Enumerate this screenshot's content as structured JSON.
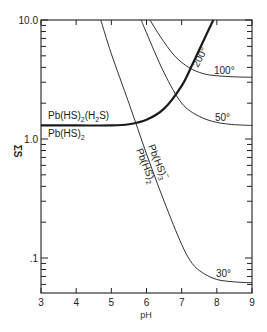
{
  "chart_data": {
    "type": "line",
    "title": "",
    "xlabel": "pH",
    "ylabel": "ΣS",
    "xlim": [
      3,
      9
    ],
    "ylim": [
      0.05,
      10.0
    ],
    "yscale": "log",
    "grid": false,
    "legend": null,
    "x_ticks": [
      3,
      4,
      5,
      6,
      7,
      8,
      9
    ],
    "x_tick_labels": [
      "3",
      "4",
      "5",
      "6",
      "7",
      "8",
      "9"
    ],
    "y_tick_labels": [
      {
        "value": 10.0,
        "label": "10.0"
      },
      {
        "value": 1.0,
        "label": "1.0"
      },
      {
        "value": 0.1,
        "label": ".1"
      }
    ],
    "series": [
      {
        "name": "200°",
        "style": "thick",
        "description": "Pb(HS)2(H2S) / Pb(HS)2 boundary",
        "x": [
          3.0,
          4.0,
          5.0,
          5.5,
          6.0,
          6.5,
          7.0,
          7.3,
          7.6,
          7.9
        ],
        "y": [
          1.3,
          1.3,
          1.3,
          1.33,
          1.45,
          1.8,
          2.8,
          4.2,
          6.5,
          10.0
        ]
      },
      {
        "name": "30°",
        "style": "thin",
        "x": [
          4.7,
          5.0,
          5.5,
          6.0,
          6.5,
          7.0,
          7.3,
          7.6,
          8.0,
          8.5,
          9.0
        ],
        "y": [
          10.0,
          5.2,
          2.0,
          0.75,
          0.3,
          0.13,
          0.09,
          0.075,
          0.066,
          0.063,
          0.062
        ]
      },
      {
        "name": "50°",
        "style": "thin",
        "x": [
          5.85,
          6.0,
          6.5,
          7.0,
          7.5,
          8.0,
          8.5,
          9.0
        ],
        "y": [
          10.0,
          7.8,
          3.6,
          2.0,
          1.55,
          1.38,
          1.32,
          1.3
        ]
      },
      {
        "name": "100°",
        "style": "thin",
        "x": [
          6.1,
          6.4,
          6.8,
          7.2,
          7.6,
          8.0,
          8.5,
          9.0
        ],
        "y": [
          10.0,
          7.2,
          5.0,
          4.0,
          3.55,
          3.4,
          3.33,
          3.3
        ]
      }
    ],
    "annotations": [
      {
        "text": "Pb(HS)2(H2S)",
        "x": 3.15,
        "y": 1.55,
        "rotation": 0
      },
      {
        "text": "Pb(HS)2",
        "x": 3.15,
        "y": 1.05,
        "rotation": 0
      },
      {
        "text": "Pb(HS)3⁻",
        "x": 5.9,
        "y": 0.75,
        "rotation": 68
      },
      {
        "text": "Pb(HS)2",
        "x": 5.6,
        "y": 0.8,
        "rotation": 68
      },
      {
        "text": "200°",
        "x": 7.25,
        "y": 5.5,
        "rotation": -62
      },
      {
        "text": "100°",
        "x": 8.1,
        "y": 3.9,
        "rotation": 0
      },
      {
        "text": "50°",
        "x": 8.1,
        "y": 1.55,
        "rotation": 0
      },
      {
        "text": "30°",
        "x": 8.0,
        "y": 0.075,
        "rotation": 0
      }
    ]
  },
  "labels": {
    "ylabel": "ΣS",
    "xlabel": "pH",
    "region_upper": "Pb(HS)",
    "region_upper_sub1": "2",
    "region_upper_mid": "(H",
    "region_upper_sub2": "2",
    "region_upper_end": "S)",
    "region_lower": "Pb(HS)",
    "region_lower_sub": "2",
    "diag_a": "Pb(HS)",
    "diag_a_sub": "3",
    "diag_a_sup": "−",
    "diag_b": "Pb(HS)",
    "diag_b_sub": "2",
    "t200": "200°",
    "t100": "100°",
    "t50": "50°",
    "t30": "30°"
  }
}
